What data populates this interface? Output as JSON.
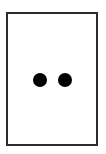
{
  "figure": {
    "canvas": {
      "width": 106,
      "height": 154,
      "background_color": "#ffffff"
    },
    "frame": {
      "name": "card-border",
      "shape": "rectangle",
      "border_color": "#2b2b2b",
      "border_width_px": 2,
      "fill_color": "#ffffff",
      "x": 6,
      "y": 12,
      "width": 92,
      "height": 134
    },
    "marks": {
      "count": 2,
      "shape": "circle",
      "color": "#000000",
      "diameter_px": 14,
      "gap_px": 11,
      "arrangement": "horizontal-pair-centered",
      "items": [
        {
          "label": "left dot",
          "cx": 40,
          "cy": 81
        },
        {
          "label": "right dot",
          "cx": 65,
          "cy": 81
        }
      ]
    }
  }
}
